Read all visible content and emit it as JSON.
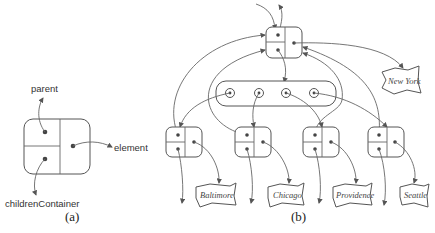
{
  "figure_a": {
    "caption": "(a)",
    "labels": {
      "parent": "parent",
      "element": "element",
      "children": "childrenContainer"
    }
  },
  "figure_b": {
    "caption": "(b)",
    "root_element": "New York",
    "children_elements": [
      "Baltimore",
      "Chicago",
      "Providence",
      "Seattle"
    ]
  },
  "colors": {
    "stroke": "#555555",
    "text": "#333333",
    "background": "#ffffff"
  }
}
